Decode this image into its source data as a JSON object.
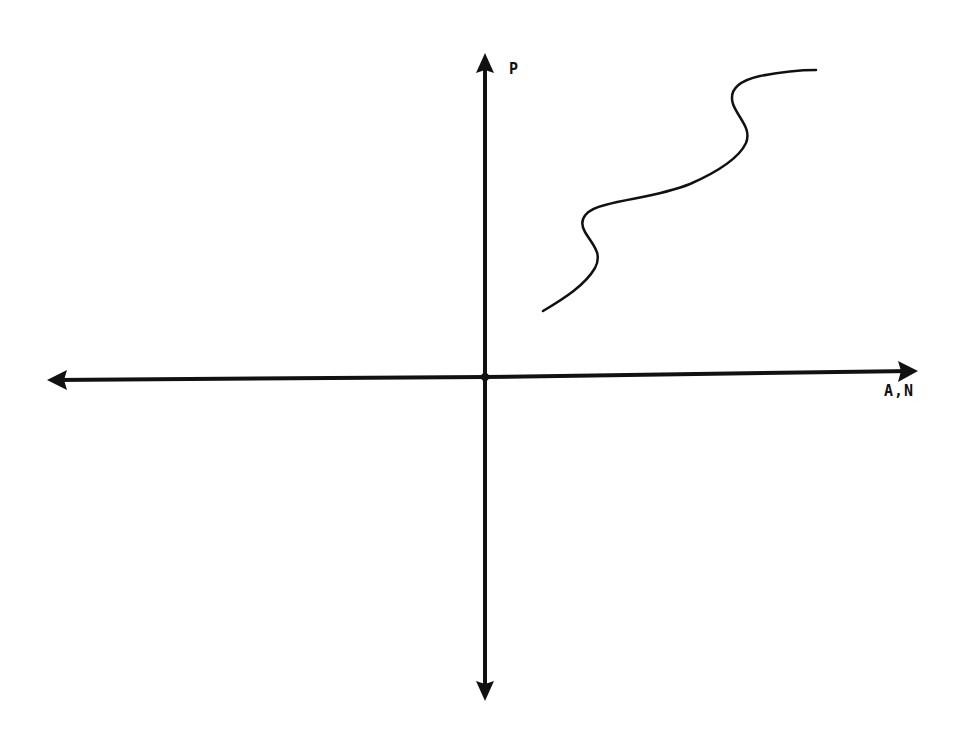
{
  "diagram": {
    "type": "cartesian-axes-sketch",
    "axes": {
      "y_label": "P",
      "x_label": "A,N",
      "x_axis": {
        "direction": "bidirectional",
        "arrows": [
          "left",
          "right"
        ]
      },
      "y_axis": {
        "direction": "bidirectional",
        "arrows": [
          "up",
          "down"
        ]
      },
      "origin_marker": true
    },
    "curve": {
      "description": "Wavy S-shaped increasing curve in the first quadrant with two backward bends",
      "quadrant": "I",
      "trend": "increasing"
    },
    "colors": {
      "background": "#ffffff",
      "ink": "#111111"
    }
  }
}
